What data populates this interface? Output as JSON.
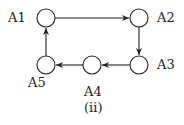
{
  "diagram": {
    "caption": "(ii)",
    "nodes": [
      {
        "id": "A1",
        "label": "A1",
        "cx": 46,
        "cy": 18
      },
      {
        "id": "A2",
        "label": "A2",
        "cx": 139,
        "cy": 18
      },
      {
        "id": "A3",
        "label": "A3",
        "cx": 139,
        "cy": 65
      },
      {
        "id": "A4",
        "label": "A4",
        "cx": 92,
        "cy": 65
      },
      {
        "id": "A5",
        "label": "A5",
        "cx": 46,
        "cy": 65
      }
    ],
    "edges": [
      {
        "from": "A1",
        "to": "A2"
      },
      {
        "from": "A2",
        "to": "A3"
      },
      {
        "from": "A3",
        "to": "A4"
      },
      {
        "from": "A4",
        "to": "A5"
      },
      {
        "from": "A5",
        "to": "A1"
      }
    ],
    "colors": {
      "stroke": "#222222",
      "fill": "#ffffff"
    }
  }
}
